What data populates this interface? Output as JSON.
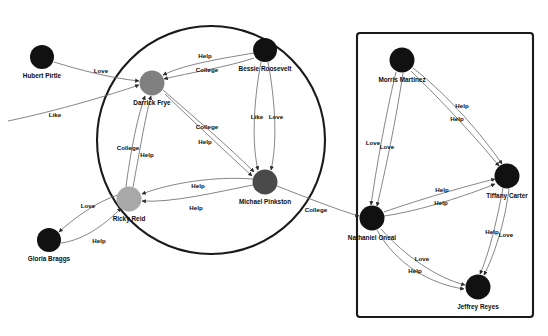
{
  "diagram": {
    "type": "social-network-graph",
    "width": 548,
    "height": 336,
    "background": "#ffffff",
    "edge_color": "#6f6f6f",
    "group_outline_color": "#1a1a1a",
    "nodes": [
      {
        "id": "hubert",
        "label": "Hubert Pirtle",
        "x": 42,
        "y": 57,
        "r": 12,
        "color": "#111111",
        "label_dx": 0,
        "label_dy": 19
      },
      {
        "id": "darrick",
        "label": "Darrick Frye",
        "x": 152,
        "y": 83,
        "r": 12.5,
        "color": "#808080",
        "label_dx": 0,
        "label_dy": 20
      },
      {
        "id": "bessie",
        "label": "Bessie Roosevelt",
        "x": 265,
        "y": 50,
        "r": 12,
        "color": "#111111",
        "label_dx": 0,
        "label_dy": 19
      },
      {
        "id": "michael",
        "label": "Michael Pinkston",
        "x": 265,
        "y": 182,
        "r": 12.5,
        "color": "#4a4a4a",
        "label_dx": 0,
        "label_dy": 20
      },
      {
        "id": "ricky",
        "label": "Ricky Reid",
        "x": 129,
        "y": 199,
        "r": 12.5,
        "color": "#a8a8a8",
        "label_dx": 0,
        "label_dy": 20
      },
      {
        "id": "gloria",
        "label": "Gloria Braggs",
        "x": 49,
        "y": 240,
        "r": 12,
        "color": "#111111",
        "label_dx": 0,
        "label_dy": 19
      },
      {
        "id": "morris",
        "label": "Morris Martinez",
        "x": 402,
        "y": 60,
        "r": 12.5,
        "color": "#111111",
        "label_dx": 0,
        "label_dy": 20
      },
      {
        "id": "tiffany",
        "label": "Tiffany Carter",
        "x": 507,
        "y": 176,
        "r": 12.5,
        "color": "#111111",
        "label_dx": 0,
        "label_dy": 20
      },
      {
        "id": "nathaniel",
        "label": "Nathaniel Oneal",
        "x": 372,
        "y": 218,
        "r": 12.5,
        "color": "#111111",
        "label_dx": 0,
        "label_dy": 20
      },
      {
        "id": "jeffrey",
        "label": "Jeffrey Reyes",
        "x": 478,
        "y": 287,
        "r": 12.5,
        "color": "#111111",
        "label_dx": 0,
        "label_dy": 20
      }
    ],
    "groups": [
      {
        "id": "circle-group",
        "shape": "circle",
        "cx": 211,
        "cy": 140,
        "r": 114
      },
      {
        "id": "rect-group",
        "shape": "rectangle",
        "x": 357,
        "y": 33,
        "width": 176,
        "height": 284,
        "rx": 3
      }
    ],
    "edges": [
      {
        "id": "e1",
        "from": "hubert",
        "to": "darrick",
        "label": "Love",
        "path": "M 54,62 C 80,70 110,78 139,81",
        "label_x": 101,
        "label_y": 71,
        "arrow": true
      },
      {
        "id": "e2",
        "from": "offscreen",
        "to": "darrick",
        "label": "Like",
        "path": "M 8,121 C 60,110 110,95 139,85",
        "label_x": 55,
        "label_y": 115,
        "arrow": true
      },
      {
        "id": "e3",
        "from": "bessie",
        "to": "darrick",
        "label": "Help",
        "path": "M 254,53 C 225,58 185,64 163,75",
        "label_x": 205,
        "label_y": 56,
        "arrow": true
      },
      {
        "id": "e4",
        "from": "bessie",
        "to": "darrick",
        "label": "College",
        "path": "M 254,58 C 228,67 188,73 164,79",
        "label_x": 207,
        "label_y": 70,
        "arrow": true
      },
      {
        "id": "e5",
        "from": "bessie",
        "to": "michael",
        "label": "Like",
        "path": "M 261,62 C 253,105 252,145 258,170",
        "label_x": 257,
        "label_y": 117,
        "arrow": true
      },
      {
        "id": "e6",
        "from": "bessie",
        "to": "michael",
        "label": "Love",
        "path": "M 268,62 C 276,105 277,145 271,170",
        "label_x": 276,
        "label_y": 117,
        "arrow": true
      },
      {
        "id": "e7",
        "from": "darrick",
        "to": "michael",
        "label": "College",
        "path": "M 163,90 C 195,118 228,146 254,172",
        "label_x": 207,
        "label_y": 127,
        "arrow": true
      },
      {
        "id": "e8",
        "from": "darrick",
        "to": "michael",
        "label": "Help",
        "path": "M 165,94 C 196,124 226,152 252,176",
        "label_x": 205,
        "label_y": 142,
        "arrow": true
      },
      {
        "id": "e9",
        "from": "ricky",
        "to": "darrick",
        "label": "College",
        "path": "M 126,187 C 130,155 137,118 145,96",
        "label_x": 128,
        "label_y": 148,
        "arrow": true
      },
      {
        "id": "e10",
        "from": "ricky",
        "to": "darrick",
        "label": "Help",
        "path": "M 133,187 C 139,155 145,118 151,96",
        "label_x": 147,
        "label_y": 155,
        "arrow": true
      },
      {
        "id": "e11",
        "from": "michael",
        "to": "ricky",
        "label": "Help",
        "path": "M 253,179 C 215,176 170,183 142,194",
        "label_x": 198,
        "label_y": 186,
        "arrow": true
      },
      {
        "id": "e12",
        "from": "michael",
        "to": "ricky",
        "label": "Help",
        "path": "M 253,185 C 217,192 172,203 142,201",
        "label_x": 196,
        "label_y": 208,
        "arrow": true
      },
      {
        "id": "e13",
        "from": "ricky",
        "to": "gloria",
        "label": "Love",
        "path": "M 118,195 C 98,201 74,218 59,232",
        "label_x": 88,
        "label_y": 206,
        "arrow": true
      },
      {
        "id": "e14",
        "from": "gloria",
        "to": "ricky",
        "label": "Help",
        "path": "M 61,243 C 85,240 108,222 121,208",
        "label_x": 99,
        "label_y": 241,
        "arrow": true
      },
      {
        "id": "e15",
        "from": "michael",
        "to": "nathaniel",
        "label": "College",
        "path": "M 277,186 C 305,197 338,210 359,216",
        "label_x": 316,
        "label_y": 210,
        "arrow": true
      },
      {
        "id": "e16",
        "from": "morris",
        "to": "nathaniel",
        "label": "Love",
        "path": "M 396,72 C 385,118 376,170 371,205",
        "label_x": 373,
        "label_y": 143,
        "arrow": true
      },
      {
        "id": "e17",
        "from": "morris",
        "to": "nathaniel",
        "label": "Love",
        "path": "M 403,73 C 396,120 385,172 377,206",
        "label_x": 387,
        "label_y": 147,
        "arrow": true
      },
      {
        "id": "e18",
        "from": "morris",
        "to": "tiffany",
        "label": "Help",
        "path": "M 413,68 C 449,96 482,135 502,164",
        "label_x": 462,
        "label_y": 106,
        "arrow": true
      },
      {
        "id": "e19",
        "from": "morris",
        "to": "tiffany",
        "label": "Help",
        "path": "M 411,71 C 443,102 478,140 499,166",
        "label_x": 457,
        "label_y": 119,
        "arrow": true
      },
      {
        "id": "e20",
        "from": "nathaniel",
        "to": "tiffany",
        "label": "Help",
        "path": "M 384,212 C 418,200 466,186 495,179",
        "label_x": 442,
        "label_y": 190,
        "arrow": true
      },
      {
        "id": "e21",
        "from": "nathaniel",
        "to": "tiffany",
        "label": "Help",
        "path": "M 384,216 C 420,211 468,195 495,184",
        "label_x": 441,
        "label_y": 203,
        "arrow": true
      },
      {
        "id": "e22",
        "from": "nathaniel",
        "to": "jeffrey",
        "label": "Love",
        "path": "M 381,229 C 405,256 437,278 465,285",
        "label_x": 422,
        "label_y": 259,
        "arrow": true
      },
      {
        "id": "e23",
        "from": "nathaniel",
        "to": "jeffrey",
        "label": "Help",
        "path": "M 377,230 C 396,264 430,284 464,289",
        "label_x": 415,
        "label_y": 271,
        "arrow": true
      },
      {
        "id": "e24",
        "from": "tiffany",
        "to": "jeffrey",
        "label": "Help",
        "path": "M 503,188 C 497,220 489,254 480,274",
        "label_x": 492,
        "label_y": 232,
        "arrow": true
      },
      {
        "id": "e25",
        "from": "tiffany",
        "to": "jeffrey",
        "label": "Love",
        "path": "M 509,189 C 505,222 494,256 484,275",
        "label_x": 506,
        "label_y": 235,
        "arrow": true
      }
    ]
  }
}
